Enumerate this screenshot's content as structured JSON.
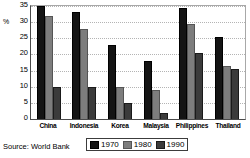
{
  "chart_data": {
    "type": "bar",
    "title": "",
    "subtitle": "",
    "xlabel": "",
    "ylabel": "%",
    "ylim": [
      0,
      35
    ],
    "ytick_labels": [
      "35",
      "30",
      "25",
      "20",
      "15",
      "10",
      "5",
      "0"
    ],
    "yticks": [
      35,
      30,
      25,
      20,
      15,
      10,
      5,
      0
    ],
    "grid": true,
    "grid_axis": "y",
    "legend_position": "bottom",
    "categories": [
      "China",
      "Indonesia",
      "Korea",
      "Malaysia",
      "Philippines",
      "Thailand"
    ],
    "series": [
      {
        "name": "1970",
        "color": "#141414",
        "values": [
          35.0,
          33.0,
          23.0,
          18.0,
          34.5,
          25.5
        ]
      },
      {
        "name": "1980",
        "color": "#7d7d7d",
        "values": [
          32.0,
          28.0,
          10.0,
          9.0,
          29.5,
          16.5
        ]
      },
      {
        "name": "1990",
        "color": "#3b3b3b",
        "values": [
          10.0,
          10.0,
          5.0,
          2.0,
          20.5,
          15.5
        ]
      }
    ],
    "annotations": {
      "source": "Source: World Bank"
    }
  },
  "legend": {
    "items": [
      {
        "label": "1970"
      },
      {
        "label": "1980"
      },
      {
        "label": "1990"
      }
    ]
  },
  "footer": {
    "source": "Source: World Bank"
  }
}
